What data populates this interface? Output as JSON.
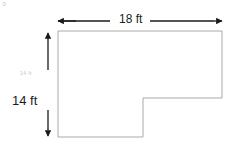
{
  "figure": {
    "title_artifact": "○",
    "shape": {
      "name": "l-shaped-polygon",
      "stroke_color": "#a9a9a9",
      "fill_color": "#ffffff",
      "stroke_width": 1,
      "vertices": [
        [
          58,
          31
        ],
        [
          222,
          31
        ],
        [
          222,
          98
        ],
        [
          143,
          98
        ],
        [
          143,
          137
        ],
        [
          58,
          137
        ]
      ]
    },
    "dimensions": {
      "width": {
        "label": "18 ft",
        "value": 18,
        "unit": "ft",
        "orientation": "horizontal",
        "arrow_color": "#1a1a1a"
      },
      "height": {
        "label": "14 ft",
        "value": 14,
        "unit": "ft",
        "orientation": "vertical",
        "arrow_color": "#1a1a1a"
      },
      "height_faint": {
        "label": "14 ft",
        "value": 14,
        "unit": "ft",
        "color": "#c2c2c2"
      }
    }
  }
}
